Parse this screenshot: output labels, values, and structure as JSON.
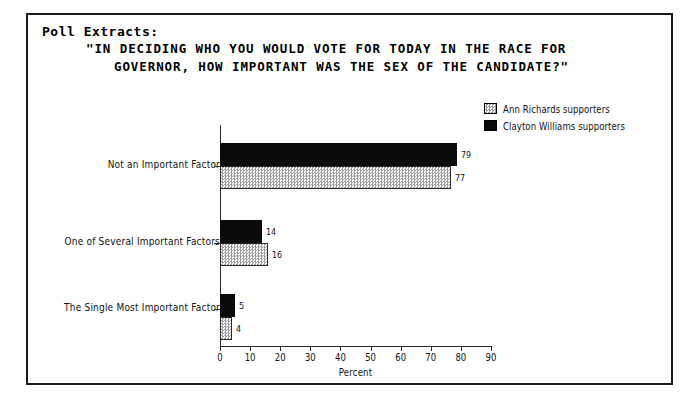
{
  "document": {
    "section_label": "Poll Extracts:",
    "question_line_1": "\"IN DECIDING WHO YOU WOULD VOTE FOR TODAY IN THE RACE FOR",
    "question_line_2": "GOVERNOR, HOW IMPORTANT WAS THE SEX OF THE CANDIDATE?\""
  },
  "legend": {
    "items": [
      {
        "label": "Ann Richards supporters",
        "swatch": "hatched-gray",
        "color": "#9e9e9e"
      },
      {
        "label": "Clayton Williams supporters",
        "swatch": "solid-black",
        "color": "#0a0a0a"
      }
    ]
  },
  "chart_data": {
    "type": "bar",
    "orientation": "horizontal",
    "title": "\"IN DECIDING WHO YOU WOULD VOTE FOR TODAY IN THE RACE FOR GOVERNOR, HOW IMPORTANT WAS THE SEX OF THE CANDIDATE?\"",
    "categories": [
      "Not an Important Factor",
      "One of Several Important Factors",
      "The Single Most Important Factor"
    ],
    "series": [
      {
        "name": "Clayton Williams supporters",
        "values": [
          79,
          14,
          5
        ],
        "color": "#0a0a0a"
      },
      {
        "name": "Ann Richards supporters",
        "values": [
          77,
          16,
          4
        ],
        "color": "#9e9e9e"
      }
    ],
    "xlabel": "Percent",
    "ylabel": "",
    "xlim": [
      0,
      90
    ],
    "xticks": [
      0,
      10,
      20,
      30,
      40,
      50,
      60,
      70,
      80,
      90
    ],
    "grid": false,
    "legend_position": "top-right",
    "value_labels": true
  }
}
